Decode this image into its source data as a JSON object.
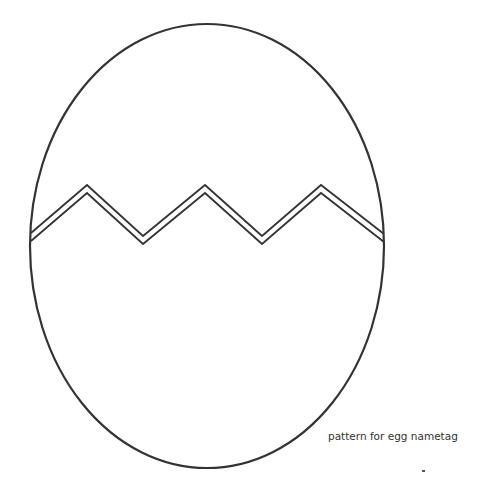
{
  "diagram": {
    "caption": "pattern for egg nametag",
    "stroke_color": "#333333",
    "background_color": "#ffffff",
    "egg": {
      "cx": 207,
      "cy": 246,
      "rx": 177,
      "ry": 222,
      "stroke_width": 2.2
    },
    "crack": {
      "description": "double zigzag line across the egg",
      "stroke_width": 1.8,
      "upper_line_points": "31,233 87,185 143,236 205,185 262,236 321,185 384,234",
      "lower_line_points": "31,241 87,193 143,244 205,193 262,244 321,193 384,242"
    },
    "marks": [
      {
        "type": "speck",
        "x": 423,
        "y": 471
      }
    ]
  }
}
